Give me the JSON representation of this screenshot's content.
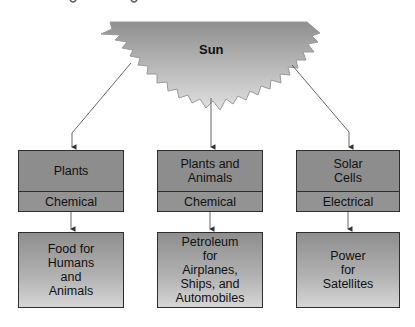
{
  "sun": {
    "label": "Sun"
  },
  "colors": {
    "sun_top": "#8f8f8f",
    "sun_bottom": "#dcdcdc",
    "box_fill": "#8d8d8d",
    "border": "#2e2e2e"
  },
  "columns": [
    {
      "source": "Plants",
      "energy_form": "Chemical",
      "use": "Food for\nHumans\nand\nAnimals"
    },
    {
      "source": "Plants and\nAnimals",
      "energy_form": "Chemical",
      "use": "Petroleum\nfor\nAirplanes,\nShips, and\nAutomobiles"
    },
    {
      "source": "Solar\nCells",
      "energy_form": "Electrical",
      "use": "Power\nfor\nSatellites"
    }
  ]
}
